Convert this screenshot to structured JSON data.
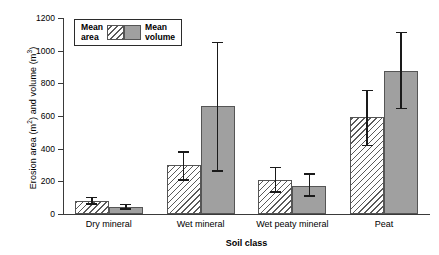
{
  "chart_data": {
    "type": "bar",
    "title": "",
    "xlabel": "Soil class",
    "ylabel": "Erosion area (m2) and volume (m3)",
    "ylabel_parts": {
      "prefix": "Erosion area (m",
      "sup1": "2",
      "middle": ") and volume (m",
      "sup2": "3",
      "suffix": ")"
    },
    "categories": [
      "Dry mineral",
      "Wet mineral",
      "Wet peaty mineral",
      "Peat"
    ],
    "ylim": [
      0,
      1200
    ],
    "yticks": [
      0,
      200,
      400,
      600,
      800,
      1000,
      1200
    ],
    "ytick_labels": [
      "0",
      "200",
      "400",
      "600",
      "800",
      "1000",
      "1200"
    ],
    "grid": false,
    "legend_position": "top-left",
    "series": [
      {
        "name": "Mean area",
        "legend_label_line1": "Mean",
        "legend_label_line2": "area",
        "swatch": "hatched",
        "color": "#ffffff",
        "values": [
          80,
          300,
          208,
          595
        ],
        "err_low": [
          55,
          205,
          130,
          415
        ],
        "err_high": [
          105,
          385,
          290,
          760
        ]
      },
      {
        "name": "Mean volume",
        "legend_label_line1": "Mean",
        "legend_label_line2": "volume",
        "swatch": "solid-gray",
        "color": "#a0a0a0",
        "values": [
          43,
          660,
          172,
          875
        ],
        "err_low": [
          25,
          260,
          105,
          640
        ],
        "err_high": [
          62,
          1055,
          250,
          1115
        ]
      }
    ]
  },
  "colors": {
    "axis": "#3a3a3a",
    "error_bar": "#1a1a1a",
    "bar_border": "#555555",
    "volume_fill": "#a0a0a0",
    "background": "#ffffff"
  }
}
